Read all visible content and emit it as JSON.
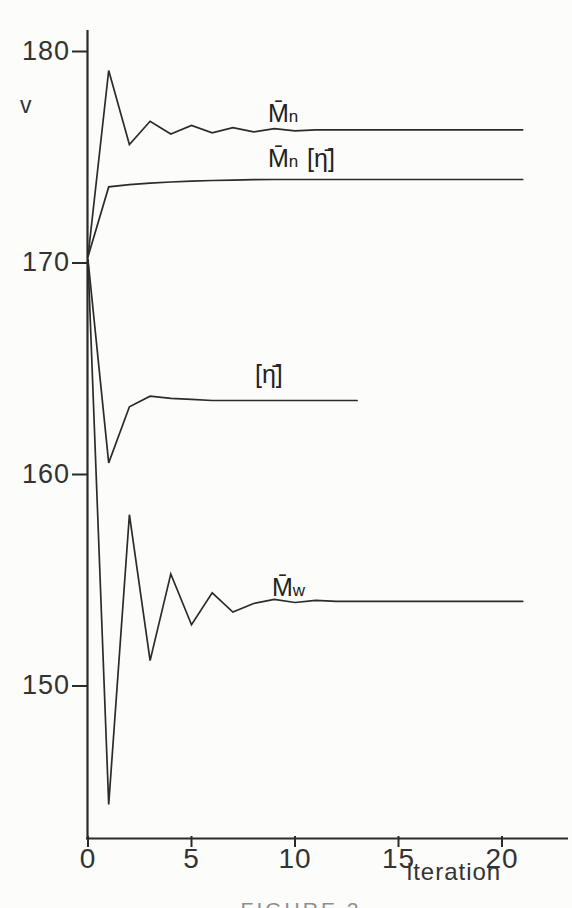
{
  "figure": {
    "ylabel": "v",
    "xlabel": "iteration",
    "caption": "FIGURE 2"
  },
  "curve_labels": {
    "mn": {
      "m": "M̄",
      "s": "n"
    },
    "mn_eta": {
      "m": "M̄",
      "s": "n",
      "suffix": "[η̄]"
    },
    "eta": {
      "text": "[η̄]"
    },
    "mw": {
      "m": "M̄",
      "s": "w"
    }
  },
  "chart_data": {
    "type": "line",
    "title": "",
    "xlabel": "iteration",
    "ylabel": "v",
    "xlim": [
      0,
      21.5
    ],
    "ylim": [
      142.5,
      181
    ],
    "xticks": [
      0,
      5,
      10,
      15,
      20
    ],
    "yticks": [
      180,
      170,
      160,
      150
    ],
    "grid": false,
    "legend_position": "inline-labels",
    "line_color": "#2b2b2b",
    "series": [
      {
        "name": "Mn (number-average)",
        "label": "M̄n",
        "x": [
          0,
          1,
          2,
          3,
          4,
          5,
          6,
          7,
          8,
          9,
          10,
          11,
          12,
          13,
          14,
          15,
          16,
          17,
          18,
          19,
          20,
          21
        ],
        "y": [
          170.3,
          179.1,
          175.6,
          176.7,
          176.1,
          176.5,
          176.15,
          176.4,
          176.2,
          176.35,
          176.25,
          176.3,
          176.3,
          176.3,
          176.3,
          176.3,
          176.3,
          176.3,
          176.3,
          176.3,
          176.3,
          176.3
        ]
      },
      {
        "name": "Mn [eta]",
        "label": "M̄n [η̄]",
        "x": [
          0,
          1,
          2,
          3,
          4,
          5,
          6,
          7,
          8,
          9,
          10,
          11,
          12,
          13,
          14,
          15,
          16,
          17,
          18,
          19,
          20,
          21
        ],
        "y": [
          170.3,
          173.6,
          173.7,
          173.78,
          173.83,
          173.87,
          173.9,
          173.92,
          173.94,
          173.95,
          173.95,
          173.95,
          173.95,
          173.95,
          173.95,
          173.95,
          173.95,
          173.95,
          173.95,
          173.95,
          173.95,
          173.95
        ]
      },
      {
        "name": "[eta] intrinsic viscosity",
        "label": "[η̄]",
        "x": [
          0,
          1,
          2,
          3,
          4,
          5,
          6,
          7,
          8,
          9,
          10,
          11,
          12,
          13
        ],
        "y": [
          170.15,
          160.55,
          163.2,
          163.7,
          163.6,
          163.55,
          163.5,
          163.5,
          163.5,
          163.5,
          163.5,
          163.5,
          163.5,
          163.5
        ]
      },
      {
        "name": "Mw (weight-average)",
        "label": "M̄w",
        "x": [
          0,
          1,
          2,
          3,
          4,
          5,
          6,
          7,
          8,
          9,
          10,
          11,
          12,
          13,
          14,
          15,
          16,
          17,
          18,
          19,
          20,
          21
        ],
        "y": [
          170.15,
          144.4,
          158.1,
          151.2,
          155.3,
          152.9,
          154.4,
          153.5,
          153.9,
          154.1,
          153.95,
          154.05,
          154.0,
          154.0,
          154.0,
          154.0,
          154.0,
          154.0,
          154.0,
          154.0,
          154.0,
          154.0
        ]
      }
    ]
  }
}
